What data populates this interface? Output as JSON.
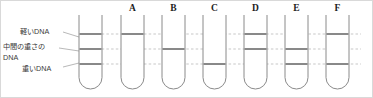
{
  "figure": {
    "background_color": "#ffffff",
    "border_color": "#d9d9d9",
    "tube_stroke_color": "#8a8a8a",
    "band_color": "#6b6b6b",
    "guide_color": "#b9b9b9"
  },
  "band_levels": [
    {
      "id": "light",
      "label": "軽いDNA",
      "y": 33
    },
    {
      "id": "intermediate",
      "label_line1": "中間の重さの",
      "label_line2": "DNA",
      "y": 48
    },
    {
      "id": "heavy",
      "label": "重いDNA",
      "y": 63
    }
  ],
  "labels": {
    "light": "軽いDNA",
    "intermediate_line1": "中間の重さの",
    "intermediate_line2": "DNA",
    "heavy": "重いDNA"
  },
  "tubes": [
    {
      "name": "reference",
      "letter": "",
      "x": 78,
      "bands": [
        "light",
        "intermediate",
        "heavy"
      ]
    },
    {
      "name": "tube-a",
      "letter": "A",
      "x": 120,
      "bands": [
        "light"
      ]
    },
    {
      "name": "tube-b",
      "letter": "B",
      "x": 161,
      "bands": [
        "intermediate"
      ]
    },
    {
      "name": "tube-c",
      "letter": "C",
      "x": 202,
      "bands": [
        "heavy"
      ]
    },
    {
      "name": "tube-d",
      "letter": "D",
      "x": 243,
      "bands": [
        "light",
        "intermediate"
      ]
    },
    {
      "name": "tube-e",
      "letter": "E",
      "x": 284,
      "bands": [
        "intermediate",
        "heavy"
      ]
    },
    {
      "name": "tube-f",
      "letter": "F",
      "x": 325,
      "bands": [
        "light",
        "heavy"
      ]
    }
  ],
  "tube_geometry": {
    "width": 23,
    "top_y": 14,
    "bottom_y": 88,
    "corner_radius": 11.5
  },
  "letters_row_y": 10
}
